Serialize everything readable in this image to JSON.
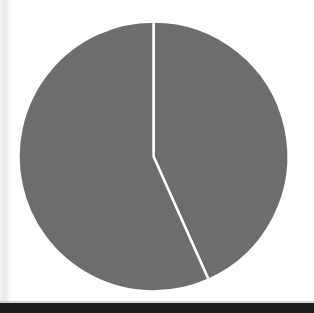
{
  "figure": {
    "title": "",
    "background_color": "#ffffff",
    "width": 314,
    "height": 313
  },
  "artifacts": {
    "bottom_bar_color": "#1d1d1d",
    "scan_band_color": "#e9e9e9"
  },
  "chart_data": {
    "type": "pie",
    "title": "",
    "subtitle": "",
    "xlabel": "",
    "ylabel": "",
    "legend": [],
    "legend_position": "none",
    "grid": false,
    "labels": [
      "Slice 1",
      "Slice 2"
    ],
    "values": [
      43.3,
      56.7
    ],
    "percentages": [
      "43.3%",
      "56.7%"
    ],
    "start_angle_deg": 0,
    "direction": "clockwise",
    "angles_deg": [
      156,
      204
    ],
    "colors": [
      "#6d6d6d",
      "#6d6d6d"
    ],
    "slice_separator_color": "#ffffff",
    "slice_separator_width_px": 2.5,
    "center_x": 153.5,
    "center_y": 156.5,
    "radius": 135,
    "annotations": [],
    "data_labels_shown": false
  }
}
